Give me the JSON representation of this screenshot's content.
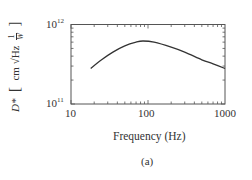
{
  "chart_data": {
    "type": "line",
    "title": "",
    "caption": "(a)",
    "xlabel": "Frequency (Hz)",
    "ylabel": "D* [cm √Hz 1/W]",
    "xscale": "log",
    "yscale": "log",
    "xlim": [
      10,
      1000
    ],
    "ylim": [
      100000000000.0,
      1000000000000.0
    ],
    "x_tick_labels": [
      "10",
      "100",
      "1000"
    ],
    "y_tick_labels": [
      "10^11",
      "10^12"
    ],
    "grid": false,
    "legend": null,
    "series": [
      {
        "name": "D*",
        "x": [
          18,
          25,
          35,
          50,
          70,
          86,
          120,
          200,
          300,
          500,
          700,
          1000
        ],
        "values": [
          280000000000.0,
          360000000000.0,
          450000000000.0,
          540000000000.0,
          600000000000.0,
          620000000000.0,
          600000000000.0,
          520000000000.0,
          450000000000.0,
          360000000000.0,
          320000000000.0,
          280000000000.0
        ]
      }
    ]
  },
  "labels": {
    "x_axis": "Frequency (Hz)",
    "y_axis_symbol": "D*",
    "y_axis_units": "cm √Hz",
    "y_axis_frac_num": "1",
    "y_axis_frac_den": "W",
    "ytick_top_base": "10",
    "ytick_top_exp": "12",
    "ytick_bottom_base": "10",
    "ytick_bottom_exp": "11",
    "xtick_10": "10",
    "xtick_100": "100",
    "xtick_1000": "1000",
    "caption": "(a)"
  }
}
